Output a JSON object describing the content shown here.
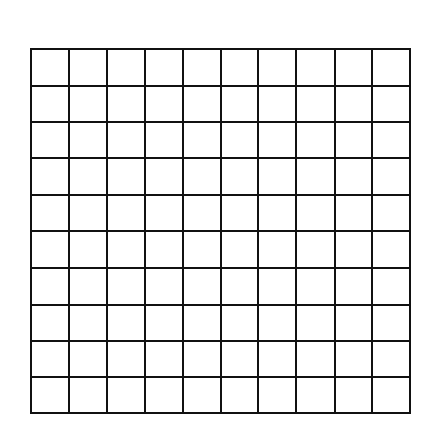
{
  "diagram": {
    "type": "square-grid",
    "rows": 10,
    "columns": 10,
    "line_color": "#111111",
    "background_color": "#ffffff",
    "line_width": 2,
    "x_lines": [
      31,
      69,
      107,
      145,
      183,
      221,
      258,
      296,
      335,
      372,
      410
    ],
    "y_lines": [
      49,
      86,
      122,
      158,
      195,
      231,
      268,
      305,
      341,
      377,
      413
    ]
  }
}
